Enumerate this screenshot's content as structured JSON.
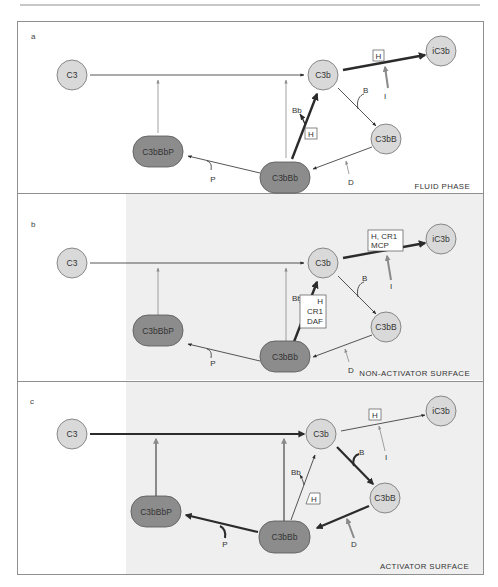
{
  "figure": {
    "panels": [
      {
        "id": "a",
        "letter": "a",
        "caption": "FLUID PHASE",
        "nodes": {
          "c3": "C3",
          "c3b": "C3b",
          "ic3b": "iC3b",
          "c3bB": "C3bB",
          "c3bBb": "C3bBb",
          "c3bBbP": "C3bBbP"
        },
        "labels": {
          "bb": "Bb",
          "b": "B",
          "i": "I",
          "p": "P",
          "d": "D"
        },
        "regulator_to_ic3b": [
          "H"
        ],
        "regulator_decay": [
          "H"
        ]
      },
      {
        "id": "b",
        "letter": "b",
        "caption": "NON-ACTIVATOR SURFACE",
        "nodes": {
          "c3": "C3",
          "c3b": "C3b",
          "ic3b": "iC3b",
          "c3bB": "C3bB",
          "c3bBb": "C3bBb",
          "c3bBbP": "C3bBbP"
        },
        "labels": {
          "bb": "Bb",
          "b": "B",
          "i": "I",
          "p": "P",
          "d": "D"
        },
        "regulator_to_ic3b": [
          "H, CR1",
          "MCP"
        ],
        "regulator_decay": [
          "H",
          "CR1",
          "DAF"
        ]
      },
      {
        "id": "c",
        "letter": "c",
        "caption": "ACTIVATOR SURFACE",
        "nodes": {
          "c3": "C3",
          "c3b": "C3b",
          "ic3b": "iC3b",
          "c3bB": "C3bB",
          "c3bBb": "C3bBb",
          "c3bBbP": "C3bBbP"
        },
        "labels": {
          "bb": "Bb",
          "b": "B",
          "i": "I",
          "p": "P",
          "d": "D"
        },
        "regulator_to_ic3b": [
          "H"
        ],
        "regulator_decay": [
          "H"
        ]
      }
    ],
    "colors": {
      "node_light": "#d9d9d9",
      "node_dark": "#8c8c8c",
      "node_stroke": "#6f6f6f",
      "arrow_dark": "#2b2b2b",
      "arrow_gray": "#8a8a8a",
      "panel_border": "#8f8f8f",
      "shade": "#efefef"
    }
  }
}
